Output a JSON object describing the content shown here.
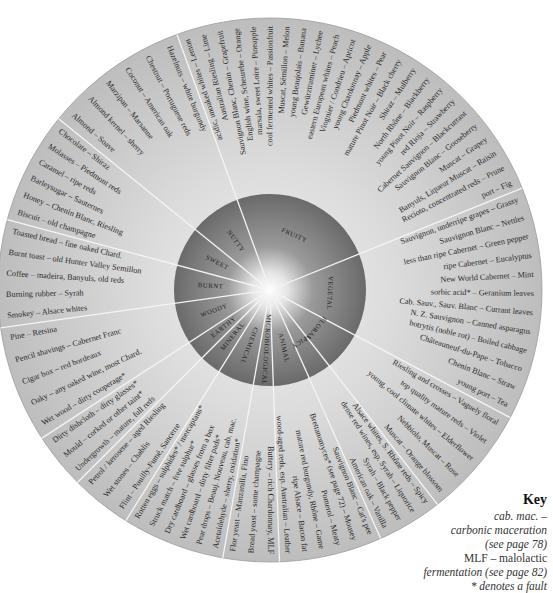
{
  "wheel": {
    "center": [
      270,
      290
    ],
    "inner_radius": 96,
    "outer_radius": 272,
    "colors": {
      "outer_ring": "#c9c9c9",
      "inner_disc": "#6f6f6f",
      "divider": "#f4f4f4",
      "glow": "#ffffff"
    },
    "categories": [
      {
        "name": "FRUITY",
        "start": -110,
        "end": -22,
        "aromas": [
          "acidic, unoaked whites – Lemon",
          "Australian Riesling – Lime",
          "Sauvignon Blanc, Chenin – Grapefruit",
          "English wine, Scheurebe – Orange",
          "marsala, sweet Loire – Pineapple",
          "cool fermented whites – Passionfruit",
          "Muscat, Sémillon – Melon",
          "young Beaujolais – Banana",
          "Gewürztraminer – Lychee",
          "eastern European whites – Peach",
          "Viognier / Condrieu – Apricot",
          "young Chardonnay – Apple",
          "Piedmont whites – Pear",
          "mature Pinot Noir – Black cherry",
          "Shiraz – Mulberry",
          "North Rhône – Blackberry",
          "young Pinot Noir – Raspberry",
          "red Rioja – Strawberry",
          "Cabernet Sauvignon – Blackcurrant",
          "Sauvignon Blanc – Gooseberry",
          "Muscat – Grapey",
          "Banyuls, Liqueur Muscat – Raisin",
          "Recioto, concentrated reds – Prune",
          "port – Fig"
        ]
      },
      {
        "name": "VEGETAL",
        "start": -22,
        "end": 28,
        "aromas": [
          "Sauvignon, underripe grapes – Grassy",
          "Sauvignon Blanc – Nettles",
          "less than ripe Cabernet – Green pepper",
          "ripe Cabernet – Eucalyptus",
          "New World Cabernet – Mint",
          "sorbic acid* – Geranium leaves",
          "Cab. Sauv., Sauv. Blanc – Currant leaves",
          "N. Z. Sauvignon – Canned asparagus",
          "botrytis (noble rot) – Boiled cabbage",
          "Châteauneuf-du-Pape – Tobacco",
          "Chenin Blanc – Straw",
          "young port – Tea"
        ]
      },
      {
        "name": "FLORAL",
        "start": 28,
        "end": 52,
        "aromas": [
          "Riesling and crosses – Vaguely floral",
          "top quality mature reds – Violet",
          "young, cool climate whites – Elderflower",
          "Nebbiolo, Muscat – Rose",
          "Muscat – Orange blossom"
        ]
      },
      {
        "name": "SPICY",
        "start": 52,
        "end": 66,
        "aromas": [
          "Alsace whites, S. Rhône reds – Spicy",
          "dense red wines, esp. Syrah – Liquorice",
          "Syrah – Black pepper",
          "American oak – Vanilla"
        ]
      },
      {
        "name": "ANIMAL",
        "start": 66,
        "end": 88,
        "aromas": [
          "Sauvignon Blanc – Cat's pee",
          "Brettanomyces* (see page 72) – Mousey",
          "Pomerol – Meaty",
          "mature red burgundy, Rhône – Game",
          "ripe Alsace – Bacon fat",
          "wood-aged reds, esp. Australian – Leather"
        ]
      },
      {
        "name": "MICROBIOLOGICAL",
        "start": 88,
        "end": 100,
        "aromas": [
          "Buttery – rich Chardonnay, MLF",
          "Bread yeast – some champagne",
          "Flor yeast – Manzanilla, Fino"
        ]
      },
      {
        "name": "CHEMICAL",
        "start": 100,
        "end": 122,
        "aromas": [
          "Acetaldehyde – sherry, oxidation*",
          "Pear drops – Beauj. Nouveau, cab. mac.",
          "Wet cardboard – dirty filter pads*",
          "Dry cardboard – glasses from a box",
          "Struck match – free sulphur*",
          "Rotten eggs – sulphides* / mercaptans*"
        ]
      },
      {
        "name": "MINERAL",
        "start": 122,
        "end": 135,
        "aromas": [
          "Flint – Pouilly-Fumé, Sancerre",
          "Wet stones – Chablis",
          "Petrol / kerosene – aged Riesling"
        ]
      },
      {
        "name": "EARTHY",
        "start": 135,
        "end": 147,
        "aromas": [
          "Undergrowth – mature, full reds",
          "Mould – corked or other taint*",
          "Dirty dishcloth – dirty glasses*"
        ]
      },
      {
        "name": "WOODY",
        "start": 147,
        "end": 172,
        "aromas": [
          "Wet wood – dirty cooperage*",
          "Oaky – any oaked wine, most Chard.",
          "Cigar box – red bordeaux",
          "Pencil shavings – Cabernet Franc",
          "Pine – Retsina"
        ]
      },
      {
        "name": "BURNT",
        "start": 172,
        "end": 195,
        "aromas": [
          "Smokey – Alsace whites",
          "Burning rubber – Syrah",
          "Coffee – madeira, Banyuls, old reds",
          "Burnt toast – old Hunter Valley Semillon",
          "Toasted bread – fine oaked Chard."
        ]
      },
      {
        "name": "SWEET",
        "start": 195,
        "end": 219,
        "aromas": [
          "Biscuit – old champagne",
          "Honey – Chenin Blanc, Riesling",
          "Barleysugar – Sauternes",
          "Caramel – ripe reds",
          "Molasses – Piedmont reds",
          "Chocolate – Shiraz"
        ]
      },
      {
        "name": "NUTTY",
        "start": 219,
        "end": 250,
        "aromas": [
          "Almond – Soave",
          "Almond kernel – sherry",
          "Marzipan – Marsanne",
          "Coconut – American oak",
          "Chestnut – Portuguese reds",
          "Hazelnuts – white burgundy"
        ]
      }
    ]
  },
  "key": {
    "title": "Key",
    "lines": [
      "cab. mac. –",
      "carbonic maceration",
      "(see page 78)",
      "MLF – malolactic",
      "fermentation (see page 82)",
      "* denotes a fault"
    ]
  }
}
